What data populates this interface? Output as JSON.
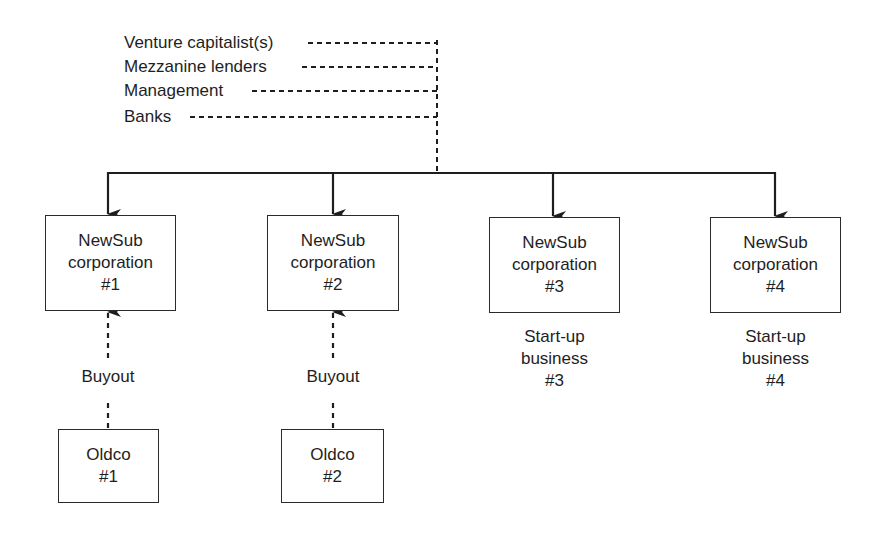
{
  "diagram": {
    "sources": [
      {
        "label": "Venture capitalist(s)"
      },
      {
        "label": "Mezzanine lenders"
      },
      {
        "label": "Management"
      },
      {
        "label": "Banks"
      }
    ],
    "newsubs": [
      {
        "line1": "NewSub",
        "line2": "corporation",
        "line3": "#1"
      },
      {
        "line1": "NewSub",
        "line2": "corporation",
        "line3": "#2"
      },
      {
        "line1": "NewSub",
        "line2": "corporation",
        "line3": "#3"
      },
      {
        "line1": "NewSub",
        "line2": "corporation",
        "line3": "#4"
      }
    ],
    "oldcos": [
      {
        "line1": "Oldco",
        "line2": "#1",
        "link_label": "Buyout"
      },
      {
        "line1": "Oldco",
        "line2": "#2",
        "link_label": "Buyout"
      }
    ],
    "startups": [
      {
        "line1": "Start-up",
        "line2": "business",
        "line3": "#3"
      },
      {
        "line1": "Start-up",
        "line2": "business",
        "line3": "#4"
      }
    ],
    "colors": {
      "line": "#1e1e1e",
      "background": "#ffffff"
    }
  }
}
